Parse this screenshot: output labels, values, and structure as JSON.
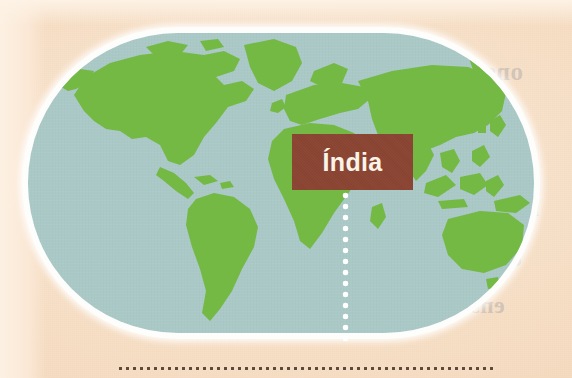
{
  "figure": {
    "kind": "world-map-illustration",
    "projection_shape": "stadium-oval",
    "callout": {
      "label": "Índia",
      "box_color": "#8b4432",
      "text_color": "#faf3e8"
    },
    "leader_line": {
      "style": "dotted",
      "color": "#ffffff",
      "orientation": "vertical"
    },
    "bottom_rule": {
      "style": "dotted",
      "color": "#5b4a3c"
    }
  },
  "palette": {
    "paper": "#f8e3cd",
    "paper_light": "#fdf1e3",
    "ocean": "#a9c8c6",
    "land": "#73b944",
    "land_shadow": "#67a93b",
    "outline": "#fdfdfb",
    "callout": "#8b4432",
    "callout_text": "#faf3e8",
    "dotted_rule": "#5b4a3c"
  },
  "landmasses": [
    "north-america",
    "greenland",
    "south-america",
    "europe",
    "africa",
    "asia",
    "southeast-asia-islands",
    "australia",
    "new-zealand",
    "japan",
    "british-isles",
    "madagascar"
  ],
  "bleed_through": [
    {
      "text": "onsi",
      "x": 478,
      "y": 58,
      "size": 25
    },
    {
      "text": "sabe",
      "x": 448,
      "y": 140,
      "size": 26
    },
    {
      "text": "iu",
      "x": 520,
      "y": 196,
      "size": 22
    },
    {
      "text": "ca",
      "x": 500,
      "y": 246,
      "size": 22
    },
    {
      "text": "ens",
      "x": 470,
      "y": 292,
      "size": 24
    }
  ]
}
